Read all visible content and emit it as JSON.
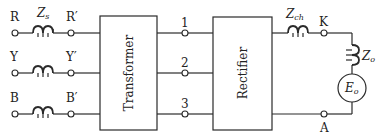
{
  "diagram": {
    "type": "circuit",
    "input_lines": [
      {
        "name": "R",
        "primed": "R′",
        "impedance_label": "Z",
        "impedance_sub": "s"
      },
      {
        "name": "Y",
        "primed": "Y′"
      },
      {
        "name": "B",
        "primed": "B′"
      }
    ],
    "blocks": {
      "transformer": "Transformer",
      "rectifier": "Rectifier"
    },
    "intermediate_terminals": [
      "1",
      "2",
      "3"
    ],
    "output": {
      "choke_label": "Z",
      "choke_sub": "ch",
      "terminal_k": "K",
      "terminal_a": "A",
      "load_impedance_label": "Z",
      "load_impedance_sub": "o",
      "source_label": "E",
      "source_sub": "o"
    }
  }
}
